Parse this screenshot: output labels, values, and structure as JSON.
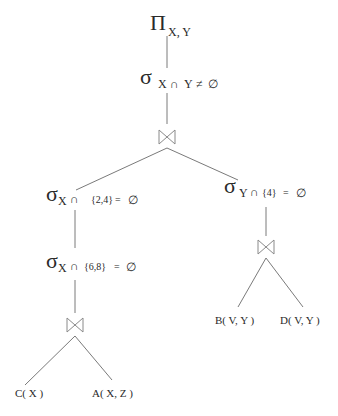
{
  "diagram": {
    "type": "relational-algebra-query-tree",
    "root": {
      "projection": {
        "symbol": "Π",
        "subscript": "X, Y"
      },
      "selection_top": {
        "symbol": "σ",
        "sub_a": "X",
        "cap": "∩",
        "sub_b": "Y",
        "rel": "≠",
        "empty": "∅"
      },
      "join_top": {
        "symbol": "⋈"
      }
    },
    "left": {
      "selection_1": {
        "symbol": "σ",
        "var": "X",
        "cap": "∩",
        "set": "{2,4}",
        "eq": "=",
        "empty": "∅"
      },
      "selection_2": {
        "symbol": "σ",
        "var": "X",
        "cap": "∩",
        "set": "{6,8}",
        "eq": "=",
        "empty": "∅"
      },
      "join": {
        "symbol": "⋈"
      },
      "leaves": [
        {
          "label": "C( X )"
        },
        {
          "label": "A( X, Z )"
        }
      ]
    },
    "right": {
      "selection": {
        "symbol": "σ",
        "var": "Y",
        "cap": "∩",
        "set": "{4}",
        "eq": "=",
        "empty": "∅"
      },
      "join": {
        "symbol": "⋈"
      },
      "leaves": [
        {
          "label": "B( V, Y )"
        },
        {
          "label": "D( V, Y )"
        }
      ]
    }
  }
}
